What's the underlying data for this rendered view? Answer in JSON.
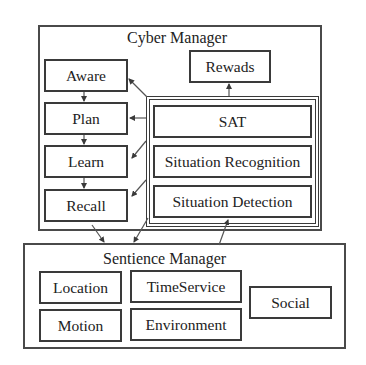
{
  "cyber_manager": {
    "title": "Cyber Manager",
    "left_column": [
      {
        "id": "aware",
        "label": "Aware"
      },
      {
        "id": "plan",
        "label": "Plan"
      },
      {
        "id": "learn",
        "label": "Learn"
      },
      {
        "id": "recall",
        "label": "Recall"
      }
    ],
    "rewards": {
      "label": "Rewads"
    },
    "sat_group": [
      {
        "id": "sat",
        "label": "SAT"
      },
      {
        "id": "situation-recognition",
        "label": "Situation Recognition"
      },
      {
        "id": "situation-detection",
        "label": "Situation Detection"
      }
    ]
  },
  "sentience_manager": {
    "title": "Sentience Manager",
    "modules": [
      {
        "id": "location",
        "label": "Location"
      },
      {
        "id": "timeservice",
        "label": "TimeService"
      },
      {
        "id": "motion",
        "label": "Motion"
      },
      {
        "id": "environment",
        "label": "Environment"
      },
      {
        "id": "social",
        "label": "Social"
      }
    ]
  },
  "colors": {
    "line": "#3a3a3a",
    "background": "#ffffff",
    "text": "#222222"
  }
}
